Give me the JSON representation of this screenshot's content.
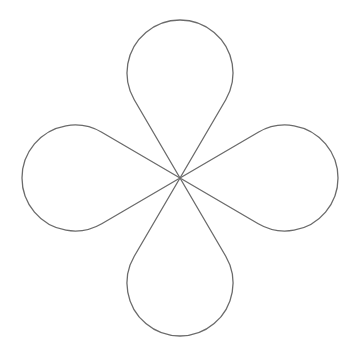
{
  "figure": {
    "background_color": "#ffffff",
    "stroke_color": "#6b6b6b",
    "center": [
      180,
      178
    ],
    "lobes": [
      {
        "name": "top",
        "direction": "up"
      },
      {
        "name": "right",
        "direction": "right"
      },
      {
        "name": "bottom",
        "direction": "down"
      },
      {
        "name": "left",
        "direction": "left"
      }
    ]
  }
}
